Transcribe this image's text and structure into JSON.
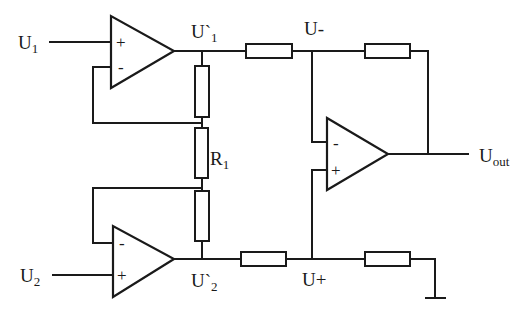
{
  "diagram": {
    "type": "circuit-schematic",
    "labels": {
      "u1": {
        "main": "U",
        "sub": "1"
      },
      "u2": {
        "main": "U",
        "sub": "2"
      },
      "u1_prime": {
        "main": "U`",
        "sub": "1"
      },
      "u2_prime": {
        "main": "U`",
        "sub": "2"
      },
      "u_minus": "U-",
      "u_plus": "U+",
      "r1": {
        "main": "R",
        "sub": "1"
      },
      "uout": {
        "main": "U",
        "sub": "out"
      }
    },
    "opamps": [
      {
        "id": "opamp-1",
        "plus": "+",
        "minus": "-"
      },
      {
        "id": "opamp-2",
        "plus": "+",
        "minus": "-"
      },
      {
        "id": "opamp-3",
        "plus": "+",
        "minus": "-"
      }
    ],
    "colors": {
      "line": "#1a1a1a",
      "background": "#ffffff"
    }
  }
}
